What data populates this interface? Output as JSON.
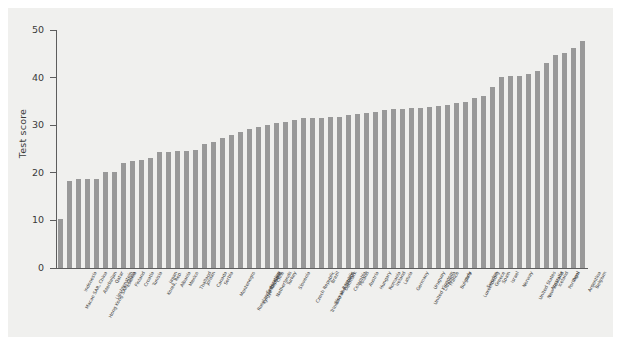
{
  "chart_data": {
    "type": "bar",
    "title": "",
    "xlabel": "",
    "ylabel": "Test score",
    "ylim": [
      0,
      50
    ],
    "yticks": [
      0,
      10,
      20,
      30,
      40,
      50
    ],
    "grid": false,
    "legend": "none",
    "bar_color": "#999999",
    "panel_color": "#f0f0ee",
    "axis_color": "#5d5d5d",
    "categories": [
      "Macao SAR, China",
      "Indonesia",
      "Hong Kong SAR, China",
      "Azerbaijan",
      "Liechtenstein",
      "Qatar",
      "Estonia",
      "Finland",
      "Croatia",
      "Tunisia",
      "Korea, Rep.",
      "Japan",
      "Albania",
      "Mexico",
      "Thailand",
      "Jordan",
      "Canada",
      "Serbia",
      "Montenegro",
      "Russian Federation",
      "Kyrgyz Republic",
      "Switzerland",
      "Netherlands",
      "Chile",
      "Turkey",
      "Slovenia",
      "Czech Republic",
      "Trinidad and Tobago",
      "Slovak Republic",
      "Brazil",
      "Denmark",
      "Colombia",
      "Poland",
      "Austria",
      "Hungary",
      "Romania",
      "Ireland",
      "Latvia",
      "Germany",
      "United Kingdom",
      "Uruguay",
      "Lithuania",
      "France",
      "Bulgaria",
      "Italy",
      "Luxembourg",
      "Sweden",
      "Greece",
      "Spain",
      "Israel",
      "Norway",
      "United States",
      "New Zealand",
      "Australia",
      "Iceland",
      "Portugal",
      "Peru",
      "Argentina",
      "Belgium"
    ],
    "values": [
      10.2,
      18.3,
      18.7,
      18.7,
      18.7,
      20.1,
      20.2,
      22.0,
      22.4,
      22.7,
      23.2,
      24.4,
      24.4,
      24.5,
      24.5,
      24.8,
      26.1,
      26.5,
      27.4,
      28.0,
      28.6,
      29.1,
      29.6,
      30.1,
      30.4,
      30.6,
      31.0,
      31.5,
      31.6,
      31.6,
      31.7,
      31.7,
      32.2,
      32.3,
      32.5,
      32.8,
      33.2,
      33.4,
      33.5,
      33.6,
      33.7,
      33.9,
      34.0,
      34.3,
      34.6,
      34.9,
      35.8,
      36.1,
      38.0,
      40.2,
      40.3,
      40.4,
      40.7,
      41.4,
      43.0,
      44.7,
      45.2,
      46.3,
      47.6
    ]
  }
}
